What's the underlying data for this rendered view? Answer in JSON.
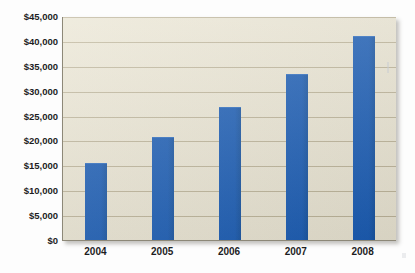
{
  "figure": {
    "background_color": "#fdfdfd",
    "plot_background_color": "#eae5d3",
    "gridline_color": "#b5ab8e",
    "bar_color": "#1a5cb4",
    "axis_color": "#8d8878",
    "title_cropped_note": ""
  },
  "chart_data": {
    "type": "bar",
    "title": "",
    "subtitle": "",
    "xlabel": "",
    "ylabel": "",
    "categories": [
      "2004",
      "2005",
      "2006",
      "2007",
      "2008"
    ],
    "values": [
      15500,
      20700,
      26800,
      33400,
      41000
    ],
    "series": [
      {
        "name": "",
        "values": [
          15500,
          20700,
          26800,
          33400,
          41000
        ]
      }
    ],
    "ylim": [
      0,
      45000
    ],
    "ytick_values": [
      0,
      5000,
      10000,
      15000,
      20000,
      25000,
      30000,
      35000,
      40000,
      45000
    ],
    "ytick_labels": [
      "$0",
      "$5,000",
      "$10,000",
      "$15,000",
      "$20,000",
      "$25,000",
      "$30,000",
      "$35,000",
      "$40,000",
      "$45,000"
    ],
    "xtick_labels": [
      "2004",
      "2005",
      "2006",
      "2007",
      "2008"
    ],
    "grid": true,
    "grid_axis": "y",
    "legend": false,
    "legend_position": "none",
    "annotations": [],
    "value_prefix": "$",
    "orientation": "vertical"
  }
}
